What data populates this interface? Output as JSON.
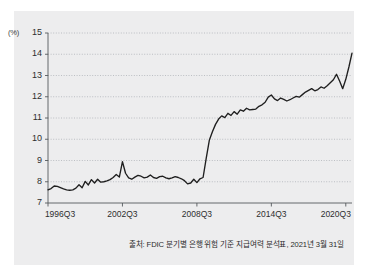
{
  "figure": {
    "background_color": "#ededee",
    "source_note": "출처: FDIC 분기별 은행 위험 기준 지급여력 분석표, 2021년 3월 31일",
    "unit_label": "(%)"
  },
  "chart_data": {
    "type": "line",
    "title": "",
    "subtitle": "",
    "xlabel": "",
    "ylabel": "(%)",
    "ylim": [
      7,
      15
    ],
    "xlim": [
      "1996Q3",
      "2021Q1"
    ],
    "grid": true,
    "legend": "none",
    "line_color": "#1f1f1f",
    "y_ticks": [
      "15",
      "14",
      "13",
      "12",
      "11",
      "10",
      "9",
      "8",
      "7"
    ],
    "y_tick_values": [
      15,
      14,
      13,
      12,
      11,
      10,
      9,
      8,
      7
    ],
    "x_ticks": [
      "1996Q3",
      "2002Q3",
      "2008Q3",
      "2014Q3",
      "2020Q3"
    ],
    "x_tick_indices": [
      0,
      24,
      48,
      72,
      96
    ],
    "annotations": [],
    "series": [
      {
        "name": "Risk-based capital ratio",
        "x": [
          "1996Q3",
          "1996Q4",
          "1997Q1",
          "1997Q2",
          "1997Q3",
          "1997Q4",
          "1998Q1",
          "1998Q2",
          "1998Q3",
          "1998Q4",
          "1999Q1",
          "1999Q2",
          "1999Q3",
          "1999Q4",
          "2000Q1",
          "2000Q2",
          "2000Q3",
          "2000Q4",
          "2001Q1",
          "2001Q2",
          "2001Q3",
          "2001Q4",
          "2002Q1",
          "2002Q2",
          "2002Q3",
          "2002Q4",
          "2003Q1",
          "2003Q2",
          "2003Q3",
          "2003Q4",
          "2004Q1",
          "2004Q2",
          "2004Q3",
          "2004Q4",
          "2005Q1",
          "2005Q2",
          "2005Q3",
          "2005Q4",
          "2006Q1",
          "2006Q2",
          "2006Q3",
          "2006Q4",
          "2007Q1",
          "2007Q2",
          "2007Q3",
          "2007Q4",
          "2008Q1",
          "2008Q2",
          "2008Q3",
          "2008Q4",
          "2009Q1",
          "2009Q2",
          "2009Q3",
          "2009Q4",
          "2010Q1",
          "2010Q2",
          "2010Q3",
          "2010Q4",
          "2011Q1",
          "2011Q2",
          "2011Q3",
          "2011Q4",
          "2012Q1",
          "2012Q2",
          "2012Q3",
          "2012Q4",
          "2013Q1",
          "2013Q2",
          "2013Q3",
          "2013Q4",
          "2014Q1",
          "2014Q2",
          "2014Q3",
          "2014Q4",
          "2015Q1",
          "2015Q2",
          "2015Q3",
          "2015Q4",
          "2016Q1",
          "2016Q2",
          "2016Q3",
          "2016Q4",
          "2017Q1",
          "2017Q2",
          "2017Q3",
          "2017Q4",
          "2018Q1",
          "2018Q2",
          "2018Q3",
          "2018Q4",
          "2019Q1",
          "2019Q2",
          "2019Q3",
          "2019Q4",
          "2020Q1",
          "2020Q2",
          "2020Q3",
          "2020Q4",
          "2021Q1"
        ],
        "values": [
          7.62,
          7.68,
          7.8,
          7.78,
          7.72,
          7.66,
          7.62,
          7.6,
          7.62,
          7.7,
          7.86,
          7.72,
          8.02,
          7.85,
          8.1,
          7.94,
          8.12,
          7.98,
          8.0,
          8.04,
          8.1,
          8.2,
          8.34,
          8.22,
          8.95,
          8.4,
          8.18,
          8.12,
          8.22,
          8.3,
          8.26,
          8.18,
          8.22,
          8.32,
          8.2,
          8.16,
          8.24,
          8.26,
          8.18,
          8.14,
          8.18,
          8.24,
          8.2,
          8.14,
          8.05,
          7.9,
          7.94,
          8.12,
          7.96,
          8.14,
          8.2,
          9.1,
          9.95,
          10.35,
          10.7,
          10.95,
          11.1,
          11.02,
          11.22,
          11.12,
          11.3,
          11.18,
          11.38,
          11.32,
          11.46,
          11.38,
          11.4,
          11.42,
          11.55,
          11.62,
          11.74,
          11.98,
          12.08,
          11.9,
          11.82,
          11.94,
          11.88,
          11.8,
          11.86,
          11.94,
          12.02,
          11.98,
          12.1,
          12.22,
          12.3,
          12.38,
          12.28,
          12.34,
          12.46,
          12.4,
          12.52,
          12.66,
          12.8,
          13.06,
          12.74,
          12.38,
          12.82,
          13.4,
          14.05
        ]
      }
    ]
  }
}
